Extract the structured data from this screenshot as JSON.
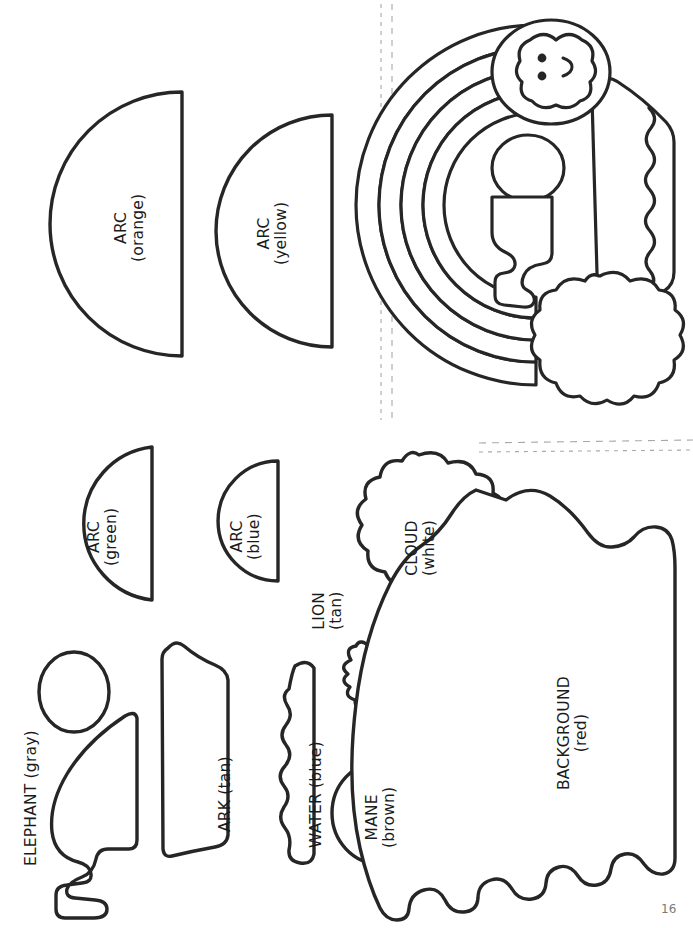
{
  "page": {
    "page_number": "16",
    "ink_color": "#262626",
    "fold_line_color": "#9a9a9a",
    "background_color": "#ffffff"
  },
  "pieces": [
    {
      "id": "arc-orange",
      "name": "ARC",
      "color_word": "(orange)",
      "shape": "half-disc"
    },
    {
      "id": "arc-yellow",
      "name": "ARC",
      "color_word": "(yellow)",
      "shape": "half-disc"
    },
    {
      "id": "arc-green",
      "name": "ARC",
      "color_word": "(green)",
      "shape": "half-disc"
    },
    {
      "id": "arc-blue",
      "name": "ARC",
      "color_word": "(blue)",
      "shape": "half-disc"
    },
    {
      "id": "cloud-white",
      "name": "CLOUD",
      "color_word": "(white)",
      "shape": "cloud"
    },
    {
      "id": "lion-tan",
      "name": "LION",
      "color_word": "(tan)",
      "shape": "lion-head"
    },
    {
      "id": "mane-brown",
      "name": "MANE",
      "color_word": "(brown)",
      "shape": "circle"
    },
    {
      "id": "elephant-gray",
      "name": "ELEPHANT",
      "color_word": "(gray)",
      "shape": "elephant-body-and-head"
    },
    {
      "id": "ark-tan",
      "name": "ARK",
      "color_word": "(tan)",
      "shape": "hull"
    },
    {
      "id": "water-blue",
      "name": "WATER",
      "color_word": "(blue)",
      "shape": "wavy-strip"
    },
    {
      "id": "background-red",
      "name": "BACKGROUND",
      "color_word": "(red)",
      "shape": "scalloped-blob"
    }
  ],
  "labels": {
    "arc_orange_line1": "ARC",
    "arc_orange_line2": "(orange)",
    "arc_yellow_line1": "ARC",
    "arc_yellow_line2": "(yellow)",
    "arc_green_line1": "ARC",
    "arc_green_line2": "(green)",
    "arc_blue_line1": "ARC",
    "arc_blue_line2": "(blue)",
    "cloud_line1": "CLOUD",
    "cloud_line2": "(white)",
    "lion_line1": "LION",
    "lion_line2": "(tan)",
    "mane_line1": "MANE",
    "mane_line2": "(brown)",
    "elephant": "ELEPHANT (gray)",
    "ark": "ARK (tan)",
    "water": "WATER (blue)",
    "background_line1": "BACKGROUND",
    "background_line2": "(red)"
  },
  "illustration": {
    "name": "assembled-sample-rainbow-ark-lion",
    "description": "Finished sample of the craft: rainbow arcs, cloud, ark, lion and elephant assembled"
  },
  "guides": {
    "vertical_dashed_lines": 2,
    "horizontal_dashed_lines": 2
  }
}
